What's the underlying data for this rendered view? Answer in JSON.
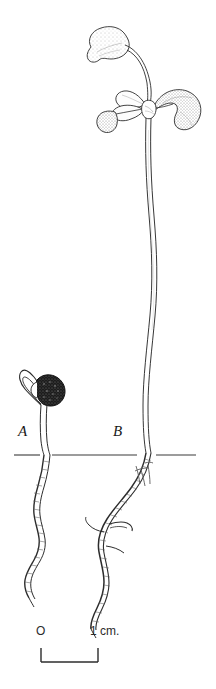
{
  "figure": {
    "background_color": "#ffffff",
    "ink_color": "#1a1a1a",
    "width_px": 216,
    "height_px": 689
  },
  "labels": {
    "specimen_a": "A",
    "specimen_b": "B"
  },
  "scale": {
    "zero_label": "O",
    "unit_label": "1 cm.",
    "bar_start_x": 41,
    "bar_end_x": 98,
    "bar_y": 662,
    "tick_height": 14
  },
  "soil_line": {
    "y": 455,
    "x_start": 14,
    "x_end": 196,
    "color": "#3a3a3a"
  },
  "specimens": [
    {
      "id": "A",
      "description": "Young seedling with dark stippled seed coat and hooked hypocotyl arch above soil, slender wavy root below",
      "seed_visible": true,
      "leaves_count": 0,
      "root_branches": 0
    },
    {
      "id": "B",
      "description": "Older seedling with long undulating hypocotyl, three kidney-shaped cotyledon-like leaves at apex plus one elevated leaf on a long arching petiole, branched wavy root below soil",
      "seed_visible": false,
      "leaves_count": 4,
      "root_branches": 2
    }
  ],
  "annotations": {
    "handwritten_mark": "handwritten pencil mark beside root B near soil line"
  },
  "icon_names": {
    "soil_line": "soil-level-line-icon",
    "scale_bar": "scale-bar-icon",
    "seed": "seed-coat-icon",
    "leaf": "leaf-icon",
    "root": "root-icon"
  }
}
